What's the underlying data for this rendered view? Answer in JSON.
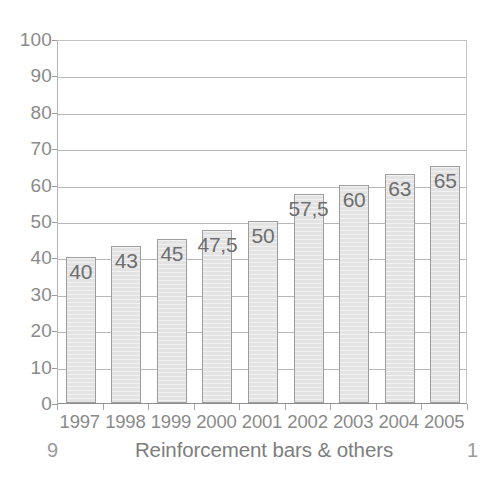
{
  "chart_data": {
    "type": "bar",
    "title": "",
    "subtitle": "",
    "xlabel": "",
    "ylabel": "",
    "categories": [
      "1997",
      "1998",
      "1999",
      "2000",
      "2001",
      "2002",
      "2003",
      "2004",
      "2005"
    ],
    "values": [
      40,
      43,
      45,
      47.5,
      50,
      57.5,
      60,
      63,
      65
    ],
    "value_labels": [
      "40",
      "43",
      "45",
      "47,5",
      "50",
      "57,5",
      "60",
      "63",
      "65"
    ],
    "ylim": [
      0,
      100
    ],
    "yticks": [
      0,
      10,
      20,
      30,
      40,
      50,
      60,
      70,
      80,
      90,
      100
    ],
    "ytick_labels": [
      "0",
      "10",
      "20",
      "30",
      "40",
      "50",
      "60",
      "70",
      "80",
      "90",
      "100"
    ],
    "grid": true,
    "legend": false,
    "bar_fill_color": "#e3e3e3",
    "bar_border_color": "#9e9e9e",
    "gridline_color": "#b8b8b8",
    "text_color": "#8a8a8a"
  },
  "caption": {
    "text": "Reinforcement bars & others",
    "page_number_left": "9",
    "page_number_right": "1"
  }
}
